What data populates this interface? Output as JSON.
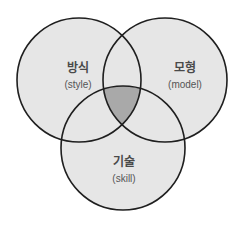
{
  "diagram": {
    "type": "venn-3",
    "colors": {
      "circle_fill": "#e6e6e6",
      "overlap_center_fill": "#a9a9a9",
      "stroke": "#1f1f1f",
      "background": "#ffffff"
    },
    "circles": [
      {
        "id": "style",
        "label_ko": "방식",
        "label_en": "(style)",
        "cx": 79,
        "cy": 80,
        "r": 62
      },
      {
        "id": "model",
        "label_ko": "모형",
        "label_en": "(model)",
        "cx": 165,
        "cy": 80,
        "r": 62
      },
      {
        "id": "skill",
        "label_ko": "기술",
        "label_en": "(skill)",
        "cx": 123,
        "cy": 148,
        "r": 62
      }
    ],
    "highlighted_region": "intersection of all three"
  }
}
